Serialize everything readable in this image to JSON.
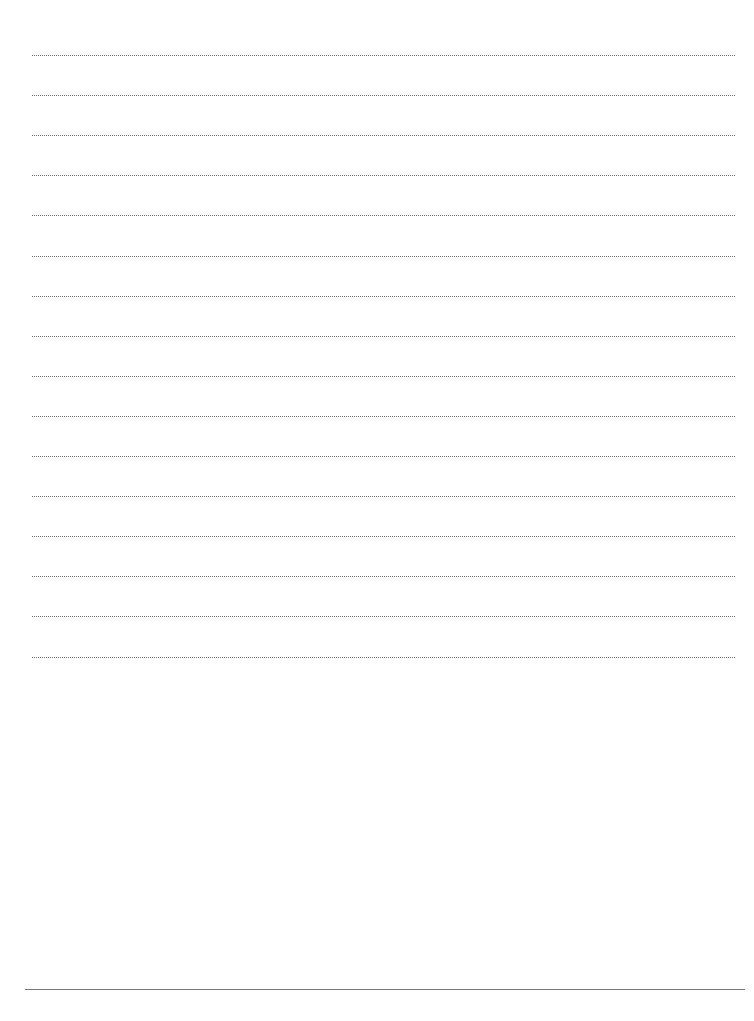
{
  "document": {
    "type": "lined-paper",
    "ruled_line_count": 16,
    "ruled_line_style": "dotted",
    "line_color": "#6e6e6e",
    "bottom_rule_style": "solid",
    "bottom_rule_color": "#7a7a7a",
    "background_color": "#ffffff",
    "text": []
  }
}
